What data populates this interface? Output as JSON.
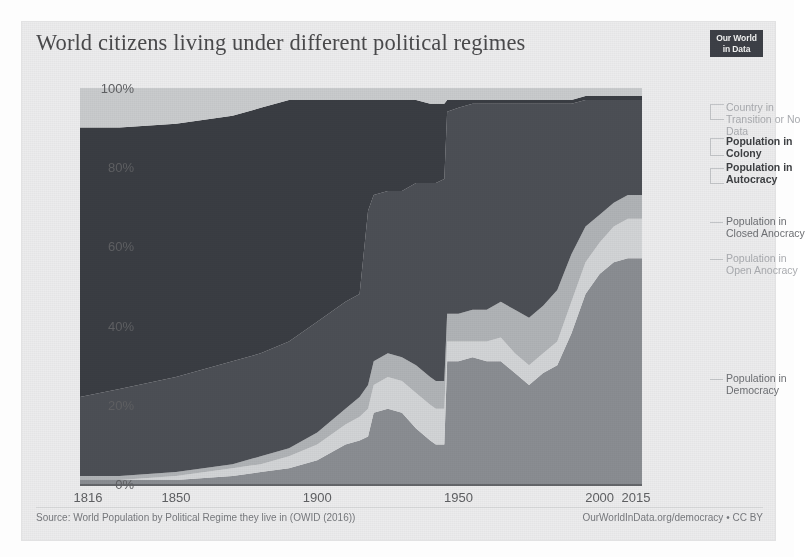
{
  "header": {
    "title": "World citizens living under different political regimes",
    "logo_line1": "Our World",
    "logo_line2": "in Data"
  },
  "footer": {
    "source": "Source: World Population by Political Regime they live in (OWID (2016))",
    "credit": "OurWorldInData.org/democracy • CC BY"
  },
  "chart_data": {
    "type": "area",
    "stacked": true,
    "normalized": true,
    "title": "World citizens living under different political regimes",
    "xlabel": "",
    "ylabel": "",
    "xlim": [
      1816,
      2015
    ],
    "ylim": [
      0,
      100
    ],
    "grid": false,
    "legend_position": "right",
    "xticks": [
      "1816",
      "1850",
      "1900",
      "1950",
      "2000",
      "2015"
    ],
    "xtick_values": [
      1816,
      1850,
      1900,
      1950,
      2000,
      2015
    ],
    "yticks": [
      "0%",
      "20%",
      "40%",
      "60%",
      "80%",
      "100%"
    ],
    "ytick_values": [
      0,
      20,
      40,
      60,
      80,
      100
    ],
    "colors": {
      "democracy": "#8a8d92",
      "open_anocracy": "#d2d4d6",
      "closed_anocracy": "#b0b3b6",
      "autocracy": "#4c4f55",
      "colony": "#3a3d43",
      "no_data": "#c9cbcd"
    },
    "x": [
      1816,
      1830,
      1850,
      1870,
      1880,
      1890,
      1900,
      1910,
      1915,
      1918,
      1920,
      1925,
      1930,
      1935,
      1940,
      1942,
      1945,
      1946,
      1950,
      1955,
      1960,
      1965,
      1970,
      1975,
      1980,
      1985,
      1990,
      1995,
      2000,
      2005,
      2010,
      2015
    ],
    "series": [
      {
        "name": "Population in Democracy",
        "key": "democracy",
        "values": [
          1,
          1,
          1,
          2,
          3,
          4,
          6,
          10,
          11,
          12,
          18,
          19,
          18,
          14,
          11,
          10,
          10,
          31,
          31,
          32,
          31,
          31,
          28,
          25,
          28,
          30,
          38,
          48,
          53,
          56,
          57,
          57
        ]
      },
      {
        "name": "Population in Open Anocracy",
        "key": "open_anocracy",
        "values": [
          0,
          0,
          1,
          2,
          2,
          3,
          4,
          5,
          6,
          7,
          7,
          8,
          8,
          9,
          9,
          9,
          9,
          5,
          5,
          4,
          5,
          6,
          5,
          5,
          5,
          6,
          8,
          8,
          8,
          9,
          10,
          10
        ]
      },
      {
        "name": "Population in Closed Anocracy",
        "key": "closed_anocracy",
        "values": [
          1,
          1,
          1,
          1,
          2,
          2,
          3,
          4,
          5,
          6,
          6,
          6,
          6,
          7,
          7,
          7,
          7,
          7,
          7,
          8,
          8,
          9,
          11,
          12,
          12,
          13,
          12,
          9,
          7,
          6,
          6,
          6
        ]
      },
      {
        "name": "Population in Autocracy",
        "key": "autocracy",
        "values": [
          20,
          22,
          24,
          26,
          26,
          27,
          28,
          27,
          26,
          44,
          42,
          41,
          42,
          46,
          49,
          50,
          51,
          51,
          52,
          52,
          52,
          50,
          52,
          54,
          51,
          47,
          38,
          32,
          29,
          26,
          24,
          24
        ]
      },
      {
        "name": "Population in Colony",
        "key": "colony",
        "values": [
          68,
          66,
          64,
          62,
          62,
          61,
          56,
          51,
          49,
          28,
          24,
          23,
          23,
          21,
          20,
          20,
          19,
          3,
          2,
          1,
          1,
          1,
          1,
          1,
          1,
          1,
          1,
          1,
          1,
          1,
          1,
          1
        ]
      },
      {
        "name": "Country in Transition or No Data",
        "key": "no_data",
        "values": [
          10,
          10,
          9,
          7,
          5,
          3,
          3,
          3,
          3,
          3,
          3,
          3,
          3,
          3,
          4,
          4,
          4,
          3,
          3,
          3,
          3,
          3,
          3,
          3,
          3,
          3,
          3,
          2,
          2,
          2,
          2,
          2
        ]
      }
    ],
    "annotations": [
      "Democracy share spikes briefly around 1920 then collapses in the 1930s",
      "Sharp jump in democracy after 1945 with decolonisation",
      "Steady rise in democracy share from about 1980 to 2015"
    ]
  },
  "legend": [
    {
      "label": "Country in\nTransition or No\nData",
      "tone": "faint",
      "top": 14,
      "connector_top": 16,
      "connector_height": 14
    },
    {
      "label": "Population in\nColony",
      "tone": "strong",
      "top": 48,
      "connector_top": 50,
      "connector_height": 16
    },
    {
      "label": "Population in\nAutocracy",
      "tone": "strong",
      "top": 74,
      "connector_top": 80,
      "connector_height": 14
    },
    {
      "label": "Population in\nClosed Anocracy",
      "tone": "mid",
      "top": 128,
      "connector_top": 134,
      "connector_height": 0
    },
    {
      "label": "Population in\nOpen Anocracy",
      "tone": "faint",
      "top": 165,
      "connector_top": 171,
      "connector_height": 0
    },
    {
      "label": "Population in\nDemocracy",
      "tone": "mid",
      "top": 285,
      "connector_top": 291,
      "connector_height": 0
    }
  ]
}
